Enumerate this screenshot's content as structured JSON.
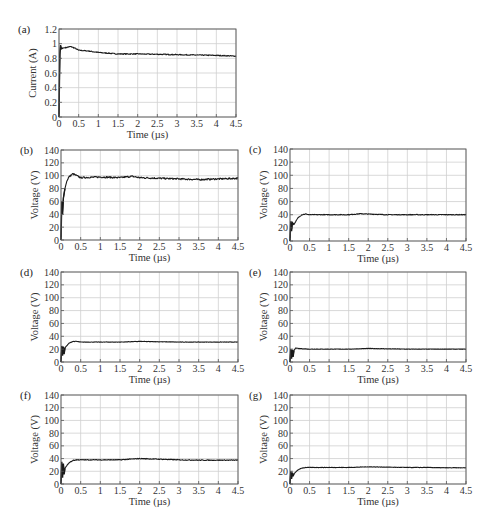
{
  "figure": {
    "width": 495,
    "height": 527,
    "colors": {
      "line": "#1a1a1a",
      "grid": "#cfcfcf",
      "axis": "#555555",
      "text": "#333333"
    }
  },
  "chart_data": [
    {
      "type": "line",
      "panel": "(a)",
      "title": "",
      "xlabel": "Time (µs)",
      "ylabel": "Current (A)",
      "xlim": [
        0,
        4.5
      ],
      "ylim": [
        0,
        1.2
      ],
      "xticks": [
        "0",
        "0.5",
        "1",
        "1.5",
        "2",
        "2.5",
        "3",
        "3.5",
        "4",
        "4.5"
      ],
      "yticks": [
        "0",
        "0.2",
        "0.4",
        "0.6",
        "0.8",
        "1",
        "1.2"
      ],
      "grid": true,
      "box": {
        "x0": 59,
        "y0": 29,
        "x1": 236,
        "y1": 117
      },
      "series": [
        {
          "name": "current",
          "x": [
            0,
            0.02,
            0.04,
            0.06,
            0.1,
            0.2,
            0.3,
            0.4,
            0.5,
            0.75,
            1,
            1.5,
            2,
            2.5,
            3,
            3.5,
            4,
            4.5
          ],
          "y": [
            0,
            0.85,
            0.98,
            0.93,
            0.94,
            0.95,
            0.96,
            0.94,
            0.91,
            0.9,
            0.88,
            0.86,
            0.86,
            0.855,
            0.85,
            0.845,
            0.84,
            0.83
          ]
        }
      ],
      "noise": 0.006
    },
    {
      "type": "line",
      "panel": "(b)",
      "xlabel": "Time (µs)",
      "ylabel": "Voltage (V)",
      "xlim": [
        0,
        4.5
      ],
      "ylim": [
        0,
        140
      ],
      "xticks": [
        "0",
        "0.5",
        "1",
        "1.5",
        "2",
        "2.5",
        "3",
        "3.5",
        "4",
        "4.5"
      ],
      "yticks": [
        "0",
        "20",
        "40",
        "60",
        "80",
        "100",
        "120",
        "140"
      ],
      "grid": true,
      "box": {
        "x0": 61,
        "y0": 150,
        "x1": 238,
        "y1": 240
      },
      "series": [
        {
          "name": "voltage",
          "x": [
            0,
            0.02,
            0.04,
            0.06,
            0.1,
            0.15,
            0.2,
            0.3,
            0.4,
            0.5,
            1,
            1.5,
            1.8,
            2,
            2.5,
            3,
            3.5,
            4,
            4.5
          ],
          "y": [
            0,
            60,
            40,
            65,
            80,
            92,
            98,
            103,
            100,
            97,
            98,
            97,
            99,
            97,
            96,
            95,
            94,
            95,
            96
          ]
        }
      ],
      "noise": 1.2
    },
    {
      "type": "line",
      "panel": "(c)",
      "xlabel": "Time (µs)",
      "ylabel": "Voltage (V)",
      "xlim": [
        0,
        4.5
      ],
      "ylim": [
        0,
        140
      ],
      "xticks": [
        "0",
        "0.5",
        "1",
        "1.5",
        "2",
        "2.5",
        "3",
        "3.5",
        "4",
        "4.5"
      ],
      "yticks": [
        "0",
        "20",
        "40",
        "60",
        "80",
        "100",
        "120",
        "140"
      ],
      "grid": true,
      "box": {
        "x0": 290,
        "y0": 149,
        "x1": 466,
        "y1": 241
      },
      "series": [
        {
          "name": "voltage",
          "x": [
            0,
            0.02,
            0.04,
            0.06,
            0.1,
            0.2,
            0.3,
            0.4,
            0.5,
            1,
            1.5,
            1.8,
            2,
            2.5,
            3,
            3.5,
            4,
            4.5
          ],
          "y": [
            0,
            30,
            15,
            28,
            25,
            35,
            40,
            41,
            40,
            40,
            40,
            41.5,
            41,
            40,
            40,
            40,
            40,
            40
          ]
        }
      ],
      "noise": 0.5
    },
    {
      "type": "line",
      "panel": "(d)",
      "xlabel": "Time (µs)",
      "ylabel": "Voltage (V)",
      "xlim": [
        0,
        4.5
      ],
      "ylim": [
        0,
        140
      ],
      "xticks": [
        "0",
        "0.5",
        "1",
        "1.5",
        "2",
        "2.5",
        "3",
        "3.5",
        "4",
        "4.5"
      ],
      "yticks": [
        "0",
        "20",
        "40",
        "60",
        "80",
        "100",
        "120",
        "140"
      ],
      "grid": true,
      "box": {
        "x0": 61,
        "y0": 272,
        "x1": 238,
        "y1": 362
      },
      "series": [
        {
          "name": "voltage",
          "x": [
            0,
            0.02,
            0.04,
            0.06,
            0.08,
            0.1,
            0.2,
            0.3,
            0.4,
            0.5,
            1,
            1.5,
            2,
            2.5,
            3,
            3.5,
            4,
            4.5
          ],
          "y": [
            0,
            25,
            10,
            24,
            12,
            22,
            29,
            32,
            32,
            31,
            31,
            31,
            32,
            31.5,
            31,
            31,
            31,
            31
          ]
        }
      ],
      "noise": 0.3
    },
    {
      "type": "line",
      "panel": "(e)",
      "xlabel": "Time (µs)",
      "ylabel": "Voltage (V)",
      "xlim": [
        0,
        4.5
      ],
      "ylim": [
        0,
        140
      ],
      "xticks": [
        "0",
        "0.5",
        "1",
        "1.5",
        "2",
        "2.5",
        "3",
        "3.5",
        "4",
        "4.5"
      ],
      "yticks": [
        "0",
        "20",
        "40",
        "60",
        "80",
        "100",
        "120",
        "140"
      ],
      "grid": true,
      "box": {
        "x0": 290,
        "y0": 272,
        "x1": 466,
        "y1": 362
      },
      "series": [
        {
          "name": "voltage",
          "x": [
            0,
            0.02,
            0.04,
            0.06,
            0.08,
            0.1,
            0.15,
            0.2,
            0.5,
            1,
            1.5,
            2,
            2.5,
            3,
            3.5,
            4,
            4.5
          ],
          "y": [
            0,
            20,
            5,
            19,
            8,
            18,
            22,
            21,
            20,
            20,
            20,
            21,
            20.5,
            20,
            20,
            20,
            20
          ]
        }
      ],
      "noise": 0.3
    },
    {
      "type": "line",
      "panel": "(f)",
      "xlabel": "Time (µs)",
      "ylabel": "Voltage (V)",
      "xlim": [
        0,
        4.5
      ],
      "ylim": [
        0,
        140
      ],
      "xticks": [
        "0",
        "0.5",
        "1",
        "1.5",
        "2",
        "2.5",
        "3",
        "3.5",
        "4",
        "4.5"
      ],
      "yticks": [
        "0",
        "20",
        "40",
        "60",
        "80",
        "100",
        "120",
        "140"
      ],
      "grid": true,
      "box": {
        "x0": 61,
        "y0": 395,
        "x1": 238,
        "y1": 484
      },
      "series": [
        {
          "name": "voltage",
          "x": [
            0,
            0.02,
            0.04,
            0.06,
            0.08,
            0.1,
            0.2,
            0.3,
            0.4,
            0.5,
            1,
            1.5,
            2,
            2.5,
            3,
            3.5,
            4,
            4.5
          ],
          "y": [
            0,
            35,
            10,
            32,
            15,
            25,
            33,
            37,
            38,
            38,
            38,
            38,
            40,
            39,
            38,
            37.5,
            37.5,
            37.5
          ]
        }
      ],
      "noise": 0.6
    },
    {
      "type": "line",
      "panel": "(g)",
      "xlabel": "Time (µs)",
      "ylabel": "Voltage (V)",
      "xlim": [
        0,
        4.5
      ],
      "ylim": [
        0,
        140
      ],
      "xticks": [
        "0",
        "0.5",
        "1",
        "1.5",
        "2",
        "2.5",
        "3",
        "3.5",
        "4",
        "4.5"
      ],
      "yticks": [
        "0",
        "20",
        "40",
        "60",
        "80",
        "100",
        "120",
        "140"
      ],
      "grid": true,
      "box": {
        "x0": 290,
        "y0": 395,
        "x1": 466,
        "y1": 484
      },
      "series": [
        {
          "name": "voltage",
          "x": [
            0,
            0.02,
            0.04,
            0.06,
            0.08,
            0.1,
            0.2,
            0.3,
            0.4,
            0.5,
            1,
            1.5,
            2,
            2.5,
            3,
            3.5,
            4,
            4.5
          ],
          "y": [
            0,
            20,
            8,
            18,
            12,
            16,
            22,
            25,
            26,
            26,
            26,
            26,
            27,
            26.5,
            26,
            26,
            25.5,
            25.5
          ]
        }
      ],
      "noise": 0.3
    }
  ]
}
